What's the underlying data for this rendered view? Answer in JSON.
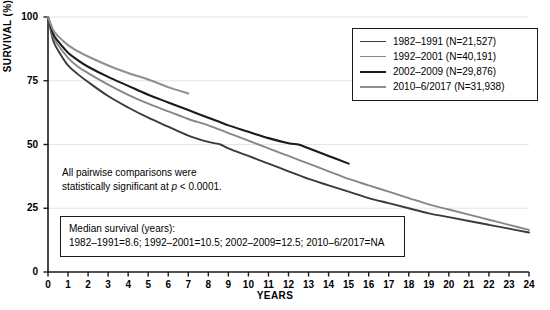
{
  "chart_data": {
    "type": "line",
    "title": "",
    "xlabel": "YEARS",
    "ylabel": "SURVIVAL (%)",
    "xlim": [
      0,
      24
    ],
    "ylim": [
      0,
      100
    ],
    "xticks": [
      "0",
      "1",
      "2",
      "3",
      "4",
      "5",
      "6",
      "7",
      "8",
      "9",
      "10",
      "11",
      "12",
      "13",
      "14",
      "15",
      "16",
      "17",
      "18",
      "19",
      "20",
      "21",
      "22",
      "23",
      "24"
    ],
    "yticks": [
      "0",
      "25",
      "50",
      "75",
      "100"
    ],
    "grid": "horizontal-faint",
    "legend_position": "top-right",
    "series": [
      {
        "name": "1982–1991 (N=21,527)",
        "color": "#3b3b3b",
        "width": 1.9,
        "median_survival": 8.6,
        "x": [
          0,
          0.25,
          0.5,
          1,
          1.5,
          2,
          3,
          4,
          5,
          6,
          7,
          8,
          8.6,
          9,
          10,
          11,
          12,
          13,
          14,
          15,
          16,
          17,
          18,
          19,
          20,
          21,
          22,
          23,
          24
        ],
        "y": [
          100,
          91,
          87,
          81,
          77.5,
          74.5,
          69,
          64.5,
          60.5,
          57,
          53.5,
          51,
          50,
          48.5,
          45.5,
          42.5,
          39.5,
          36.5,
          34,
          31.5,
          29,
          27,
          25,
          23,
          21.5,
          20,
          18.5,
          17,
          15.5
        ]
      },
      {
        "name": "1992–2001 (N=40,191)",
        "color": "#878787",
        "width": 1.9,
        "median_survival": 10.5,
        "x": [
          0,
          0.25,
          0.5,
          1,
          1.5,
          2,
          3,
          4,
          5,
          6,
          7,
          8,
          9,
          10,
          10.5,
          11,
          12,
          13,
          14,
          15,
          16,
          17,
          18,
          19,
          20,
          21,
          22,
          23,
          24
        ],
        "y": [
          100,
          92.5,
          89,
          84,
          80.5,
          78,
          73.5,
          69.5,
          66,
          63,
          60,
          57.5,
          54.5,
          51.5,
          50,
          48.5,
          45.5,
          42.5,
          39.5,
          36.5,
          34,
          31.5,
          29,
          26.5,
          24.5,
          22.5,
          20.5,
          18.5,
          16.5
        ]
      },
      {
        "name": "2002–2009 (N=29,876)",
        "color": "#1a1a1a",
        "width": 2.1,
        "median_survival": 12.5,
        "x": [
          0,
          0.25,
          0.5,
          1,
          1.5,
          2,
          3,
          4,
          5,
          6,
          7,
          8,
          9,
          10,
          11,
          12,
          12.5,
          13,
          14,
          15
        ],
        "y": [
          100,
          93.5,
          90.5,
          86,
          83,
          80.5,
          76.5,
          73,
          69.5,
          66.5,
          63.5,
          60.5,
          57.5,
          55,
          52.5,
          50.5,
          50,
          48.5,
          45.5,
          42.5
        ]
      },
      {
        "name": "2010–6/2017 (N=31,938)",
        "color": "#8f8f8f",
        "width": 2.1,
        "median_survival": "NA",
        "x": [
          0,
          0.25,
          0.5,
          1,
          1.5,
          2,
          3,
          4,
          5,
          6,
          7
        ],
        "y": [
          100,
          95,
          92.5,
          89,
          86.5,
          84.5,
          81,
          78,
          75.5,
          72.5,
          70
        ]
      }
    ],
    "annotations": {
      "significance_note_line1": "All pairwise comparisons were",
      "significance_note_line2_prefix": "statistically significant at ",
      "significance_note_line2_italic": "p",
      "significance_note_line2_suffix": " < 0.0001.",
      "median_box_title": "Median survival (years):",
      "median_box_values": "1982–1991=8.6; 1992–2001=10.5; 2002–2009=12.5; 2010–6/2017=NA"
    }
  }
}
